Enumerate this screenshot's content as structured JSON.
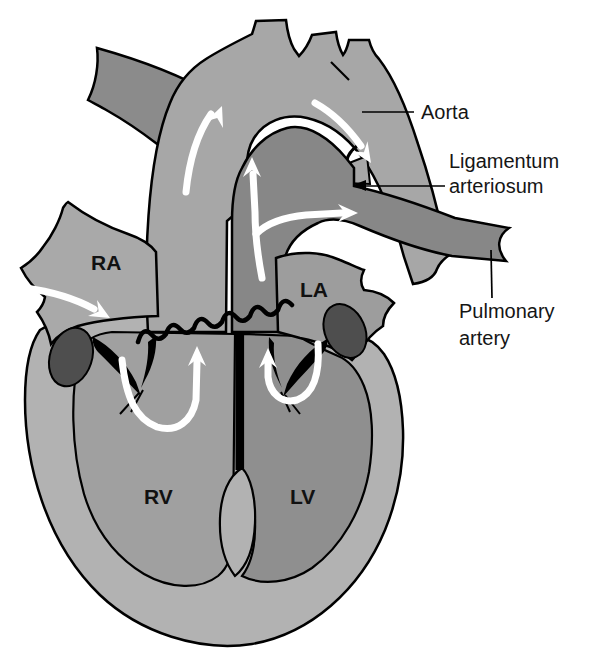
{
  "diagram": {
    "type": "anatomical-diagram",
    "labels": {
      "ra": "RA",
      "la": "LA",
      "rv": "RV",
      "lv": "LV"
    },
    "annotations": {
      "aorta": "Aorta",
      "ligamentum_line1": "Ligamentum",
      "ligamentum_line2": "arteriosum",
      "pulmonary_line1": "Pulmonary",
      "pulmonary_line2": "artery"
    },
    "colors": {
      "background": "#ffffff",
      "outline": "#000000",
      "heart_wall": "#b2b2b2",
      "right_ventricle": "#a0a0a0",
      "left_ventricle": "#8f8f8f",
      "septum_wedge": "#b2b2b2",
      "right_atrium": "#a9a9a9",
      "left_atrium": "#9d9d9d",
      "aorta": "#a7a7a7",
      "ligamentum": "#a7a7a7",
      "pulmonary_vessels": "#878787",
      "superior_vena_cava": "#8b8b8b",
      "appendage_dark": "#4e4e4e",
      "flow_arrow": "#ffffff",
      "label_text": "#151515"
    }
  }
}
